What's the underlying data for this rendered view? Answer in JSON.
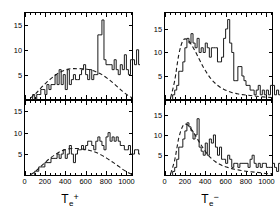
{
  "figure": {
    "background_color": "#ffffff",
    "line_color": "#1a1a1a",
    "panel_count": 4,
    "layout": "2x2"
  },
  "axis_titles": {
    "left": {
      "symbol": "T",
      "subscript": "e",
      "superscript": "+",
      "full": "Te+"
    },
    "right": {
      "symbol": "T",
      "subscript": "e",
      "superscript": "−",
      "full": "Te−"
    }
  },
  "chart_data": [
    {
      "id": "panel-top-left",
      "type": "bar",
      "title": "",
      "xlabel": "Te+",
      "ylabel": "",
      "xlim": [
        0,
        1060
      ],
      "ylim": [
        0,
        17.5
      ],
      "xticks": [
        0,
        200,
        400,
        600,
        800,
        1000
      ],
      "xticklabels": [
        "",
        "",
        "",
        "",
        "",
        ""
      ],
      "yticks": [
        0,
        5,
        10,
        15
      ],
      "yticklabels": [
        "0",
        "5",
        "10",
        "15"
      ],
      "minor_xticks_step": 50,
      "grid": false,
      "legend": "none",
      "bin_width": 20,
      "bin_start": 60,
      "series": [
        {
          "name": "positron spectrum (upper)",
          "style": "step-histogram",
          "values": [
            0,
            1,
            0,
            1,
            1,
            2,
            2,
            1,
            3,
            2,
            3,
            3,
            5,
            3,
            6,
            3,
            5,
            2,
            6,
            3,
            4,
            5,
            4,
            4,
            5,
            6,
            7,
            5,
            4,
            6,
            4,
            5,
            5,
            13,
            13,
            16,
            8,
            7,
            7,
            7,
            6,
            8,
            6,
            5,
            7,
            6,
            9,
            6,
            5,
            8,
            8,
            7,
            10,
            7,
            8,
            6,
            5,
            6,
            5,
            6,
            6,
            5,
            4,
            4,
            4,
            3,
            3,
            5,
            3,
            3,
            4,
            2,
            3,
            2,
            2,
            2,
            4,
            2,
            1,
            5,
            1,
            1,
            1
          ]
        },
        {
          "name": "fit curve (dashed)",
          "style": "dashed-line",
          "x": [
            60,
            110,
            160,
            210,
            260,
            310,
            360,
            410,
            460,
            510,
            560,
            610,
            660,
            710,
            760,
            810,
            860,
            910,
            960,
            1010,
            1060
          ],
          "y": [
            0.3,
            1.2,
            2.3,
            3.3,
            4.2,
            5.0,
            5.6,
            6.0,
            6.2,
            6.2,
            6.2,
            6.1,
            5.9,
            5.5,
            5.0,
            4.3,
            3.5,
            2.6,
            1.7,
            0.9,
            0.3
          ]
        }
      ]
    },
    {
      "id": "panel-bottom-left",
      "type": "bar",
      "title": "",
      "xlabel": "Te+",
      "ylabel": "",
      "xlim": [
        0,
        1060
      ],
      "ylim": [
        0,
        17.5
      ],
      "xticks": [
        0,
        200,
        400,
        600,
        800,
        1000
      ],
      "xticklabels": [
        "0",
        "200",
        "400",
        "600",
        "800",
        "1000"
      ],
      "yticks": [
        0,
        5,
        10,
        15
      ],
      "yticklabels": [
        "0",
        "5",
        "10",
        "15"
      ],
      "minor_xticks_step": 50,
      "grid": false,
      "legend": "none",
      "bin_width": 20,
      "bin_start": 60,
      "series": [
        {
          "name": "positron spectrum (lower)",
          "style": "step-histogram",
          "values": [
            0,
            0,
            1,
            1,
            2,
            2,
            2,
            3,
            3,
            3,
            4,
            4,
            4,
            5,
            4,
            5,
            6,
            4,
            5,
            7,
            5,
            3,
            5,
            6,
            6,
            7,
            6,
            7,
            8,
            8,
            7,
            6,
            8,
            9,
            8,
            7,
            6,
            9,
            10,
            8,
            9,
            8,
            9,
            8,
            7,
            7,
            6,
            6,
            7,
            5,
            5,
            6,
            6,
            5,
            5,
            4,
            7,
            7,
            7,
            4,
            4,
            5,
            4,
            4,
            3,
            3,
            4,
            2,
            2,
            3,
            2,
            2,
            1,
            2,
            2,
            1,
            1,
            1,
            1,
            1,
            0,
            0,
            0
          ]
        },
        {
          "name": "fit curve (dashed)",
          "style": "dashed-line",
          "x": [
            60,
            110,
            160,
            210,
            260,
            310,
            360,
            410,
            460,
            510,
            560,
            610,
            660,
            710,
            760,
            810,
            860,
            910,
            960,
            1010,
            1060
          ],
          "y": [
            0.2,
            1.0,
            2.1,
            3.2,
            4.2,
            5.0,
            5.7,
            6.1,
            6.3,
            6.3,
            6.2,
            6.0,
            5.7,
            5.3,
            4.7,
            4.0,
            3.2,
            2.4,
            1.5,
            0.8,
            0.2
          ]
        }
      ]
    },
    {
      "id": "panel-top-right",
      "type": "bar",
      "title": "",
      "xlabel": "Te−",
      "ylabel": "",
      "xlim": [
        0,
        1060
      ],
      "ylim": [
        0,
        18.5
      ],
      "xticks": [
        0,
        200,
        400,
        600,
        800,
        1000
      ],
      "xticklabels": [
        "",
        "",
        "",
        "",
        "",
        ""
      ],
      "yticks": [
        0,
        5,
        10,
        15
      ],
      "yticklabels": [
        "0",
        "5",
        "10",
        "15"
      ],
      "minor_xticks_step": 50,
      "grid": false,
      "legend": "none",
      "bin_width": 20,
      "bin_start": 60,
      "series": [
        {
          "name": "electron spectrum (upper)",
          "style": "step-histogram",
          "values": [
            0,
            1,
            2,
            3,
            6,
            6,
            8,
            11,
            13,
            12,
            14,
            12,
            11,
            13,
            10,
            11,
            10,
            12,
            11,
            9,
            11,
            11,
            11,
            8,
            8,
            9,
            13,
            15,
            17,
            12,
            10,
            4,
            4,
            7,
            7,
            5,
            4,
            3,
            3,
            2,
            2,
            1,
            2,
            3,
            1,
            2,
            1,
            2,
            1,
            3,
            3,
            1,
            2,
            1,
            2,
            2,
            1,
            2,
            1,
            1,
            1,
            1,
            0,
            1,
            1,
            0,
            1,
            0,
            0,
            1,
            0,
            0,
            0,
            0,
            0,
            0,
            0,
            0,
            0,
            0,
            0,
            0,
            0
          ]
        },
        {
          "name": "fit curve (dashed)",
          "style": "dashed-line",
          "x": [
            60,
            100,
            140,
            180,
            220,
            260,
            300,
            340,
            380,
            420,
            460,
            500,
            540,
            580,
            620,
            660,
            700,
            740,
            780,
            820,
            900,
            1000,
            1060
          ],
          "y": [
            0.4,
            4.0,
            9.5,
            12.5,
            12.8,
            11.8,
            10.3,
            8.6,
            6.9,
            5.5,
            4.3,
            3.4,
            2.7,
            2.2,
            1.8,
            1.5,
            1.3,
            1.1,
            1.0,
            0.9,
            0.7,
            0.5,
            0.4
          ]
        }
      ]
    },
    {
      "id": "panel-bottom-right",
      "type": "bar",
      "title": "",
      "xlabel": "Te−",
      "ylabel": "",
      "xlim": [
        0,
        1060
      ],
      "ylim": [
        0,
        18.5
      ],
      "xticks": [
        0,
        200,
        400,
        600,
        800,
        1000
      ],
      "xticklabels": [
        "0",
        "200",
        "400",
        "600",
        "800",
        "1000"
      ],
      "yticks": [
        0,
        5,
        10,
        15
      ],
      "yticklabels": [
        "0",
        "5",
        "10",
        "15"
      ],
      "minor_xticks_step": 50,
      "grid": false,
      "legend": "none",
      "bin_width": 20,
      "bin_start": 60,
      "series": [
        {
          "name": "electron spectrum (lower)",
          "style": "step-histogram",
          "values": [
            0,
            1,
            2,
            4,
            7,
            7,
            9,
            11,
            13,
            12,
            11,
            9,
            10,
            14,
            7,
            6,
            5,
            8,
            5,
            9,
            8,
            10,
            7,
            5,
            7,
            4,
            4,
            3,
            5,
            4,
            2,
            3,
            3,
            2,
            3,
            3,
            3,
            3,
            2,
            4,
            5,
            3,
            2,
            3,
            2,
            3,
            3,
            2,
            2,
            2,
            3,
            2,
            1,
            3,
            2,
            1,
            1,
            1,
            2,
            1,
            1,
            1,
            1,
            0,
            1,
            1,
            0,
            1,
            0,
            1,
            0,
            0,
            1,
            0,
            0,
            0,
            0,
            0,
            0,
            0,
            0,
            0,
            0
          ]
        },
        {
          "name": "fit curve (dashed)",
          "style": "dashed-line",
          "x": [
            60,
            100,
            140,
            180,
            220,
            260,
            300,
            340,
            380,
            420,
            460,
            500,
            540,
            580,
            620,
            660,
            700,
            740,
            780,
            820,
            900,
            1000,
            1060
          ],
          "y": [
            0.4,
            3.8,
            9.2,
            12.2,
            12.6,
            11.5,
            10.0,
            8.3,
            6.7,
            5.3,
            4.2,
            3.4,
            2.8,
            2.3,
            2.0,
            1.7,
            1.5,
            1.3,
            1.1,
            1.0,
            0.8,
            0.5,
            0.4
          ]
        }
      ]
    }
  ]
}
